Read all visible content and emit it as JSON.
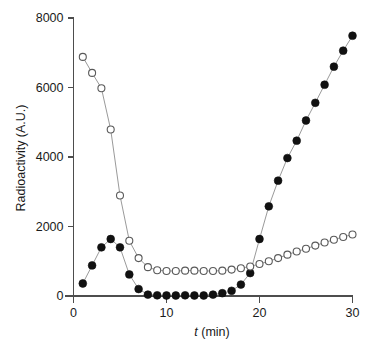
{
  "chart_data": {
    "type": "line",
    "title": "",
    "subtitle": "",
    "xlabel_italic": "t",
    "xlabel_rest": " (min)",
    "xlabel": "t (min)",
    "ylabel": "Radioactivity (A.U.)",
    "xlim": [
      0,
      31
    ],
    "ylim": [
      0,
      8400
    ],
    "xticks": [
      0,
      10,
      20,
      30
    ],
    "xtick_labels": [
      "0",
      "10",
      "20",
      "30"
    ],
    "yticks": [
      0,
      2000,
      4000,
      6000,
      8000
    ],
    "ytick_labels": [
      "0",
      "2000",
      "4000",
      "6000",
      "8000"
    ],
    "grid": false,
    "legend": "none",
    "x": [
      1,
      2,
      3,
      4,
      5,
      6,
      7,
      8,
      9,
      10,
      11,
      12,
      13,
      14,
      15,
      16,
      17,
      18,
      19,
      20,
      21,
      22,
      23,
      24,
      25,
      26,
      27,
      28,
      29,
      30
    ],
    "series": [
      {
        "name": "filled-circles",
        "marker": "filled-circle",
        "marker_fill": "#111111",
        "marker_edge": "#111111",
        "line_color": "#9a9a9a",
        "values": [
          360,
          880,
          1400,
          1640,
          1400,
          620,
          200,
          40,
          20,
          15,
          15,
          20,
          15,
          15,
          40,
          80,
          150,
          330,
          660,
          1640,
          2580,
          3320,
          3970,
          4470,
          5050,
          5560,
          6080,
          6600,
          7060,
          7490
        ]
      },
      {
        "name": "open-circles",
        "marker": "open-circle",
        "marker_fill": "#ffffff",
        "marker_edge": "#5a5a5a",
        "line_color": "#9a9a9a",
        "values": [
          6880,
          6420,
          5980,
          4790,
          2890,
          1590,
          1090,
          830,
          740,
          720,
          720,
          730,
          730,
          720,
          720,
          730,
          760,
          800,
          850,
          920,
          1000,
          1090,
          1190,
          1280,
          1360,
          1450,
          1540,
          1620,
          1700,
          1770
        ]
      }
    ]
  },
  "colors": {
    "axis": "#4d4d4d",
    "text": "#1a1a1a",
    "line": "#9a9a9a",
    "filled_marker": "#111111",
    "open_marker_edge": "#5a5a5a",
    "background": "#ffffff"
  }
}
